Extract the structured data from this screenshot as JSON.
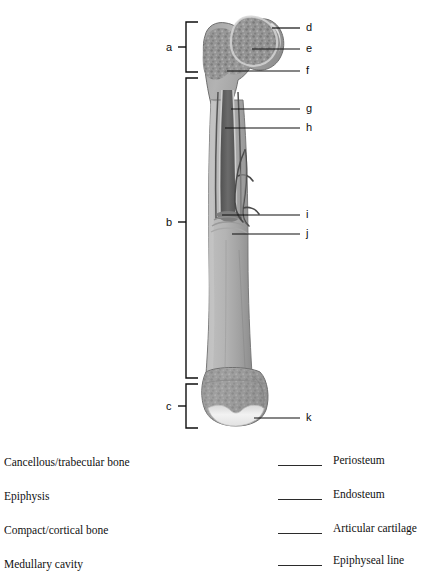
{
  "figure": {
    "brackets": [
      {
        "id": "a",
        "label": "a"
      },
      {
        "id": "b",
        "label": "b"
      },
      {
        "id": "c",
        "label": "c"
      }
    ],
    "callouts": [
      {
        "id": "d",
        "label": "d"
      },
      {
        "id": "e",
        "label": "e"
      },
      {
        "id": "f",
        "label": "f"
      },
      {
        "id": "g",
        "label": "g"
      },
      {
        "id": "h",
        "label": "h"
      },
      {
        "id": "i",
        "label": "i"
      },
      {
        "id": "j",
        "label": "j"
      },
      {
        "id": "k",
        "label": "k"
      }
    ]
  },
  "wordbank": {
    "left_column": [
      {
        "term": "Cancellous/trabecular bone"
      },
      {
        "term": "Epiphysis"
      },
      {
        "term": "Compact/cortical bone"
      },
      {
        "term": "Medullary cavity"
      }
    ],
    "right_column": [
      {
        "term": "Periosteum"
      },
      {
        "term": "Endosteum"
      },
      {
        "term": "Articular cartilage"
      },
      {
        "term": "Epiphyseal line"
      }
    ]
  },
  "colors": {
    "bone_shaft": "#a9a9a9",
    "bone_shaft_dark": "#8e8e8e",
    "bone_trabecular": "#8d8d8d",
    "bone_highlight": "#c9c9c9",
    "cartilage": "#ececec",
    "medullary_cavity": "#5e5e5e",
    "line": "#111111",
    "background": "#ffffff"
  }
}
